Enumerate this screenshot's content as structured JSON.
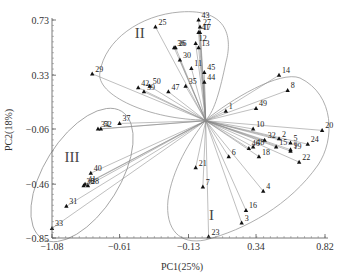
{
  "chart_data": {
    "type": "scatter",
    "subtype": "pca-biplot",
    "title": "",
    "xlabel": "PC1(25%)",
    "ylabel": "PC2(18%)",
    "xlim": [
      -1.08,
      0.82
    ],
    "ylim": [
      -0.85,
      0.73
    ],
    "xticks": [
      -1.08,
      -0.61,
      -0.13,
      0.34,
      0.82
    ],
    "xtick_labels": [
      "-1.08",
      "-0.61",
      "-0.13",
      "0.34",
      "0.82"
    ],
    "yticks": [
      0.73,
      0.33,
      -0.06,
      -0.46,
      -0.85
    ],
    "ytick_labels": [
      "0.73",
      "0.33",
      "-0.06",
      "-0.46",
      "-0.85"
    ],
    "grid": false,
    "origin": [
      -0.01,
      0.0
    ],
    "groups": [
      {
        "name": "I",
        "label_pos": [
          0.03,
          -0.72
        ]
      },
      {
        "name": "II",
        "label_pos": [
          -0.47,
          0.6
        ]
      },
      {
        "name": "III",
        "label_pos": [
          -0.94,
          -0.3
        ]
      }
    ],
    "points": [
      {
        "id": "25",
        "x": -0.36,
        "y": 0.68,
        "group": "II"
      },
      {
        "id": "29",
        "x": -0.8,
        "y": 0.34,
        "group": "II"
      },
      {
        "id": "42",
        "x": -0.48,
        "y": 0.24,
        "group": "II"
      },
      {
        "id": "39",
        "x": -0.44,
        "y": 0.21,
        "group": "II"
      },
      {
        "id": "50",
        "x": -0.4,
        "y": 0.25,
        "group": "II"
      },
      {
        "id": "47",
        "x": -0.27,
        "y": 0.21,
        "group": "II"
      },
      {
        "id": "35",
        "x": -0.15,
        "y": 0.25,
        "group": "II"
      },
      {
        "id": "36",
        "x": -0.23,
        "y": 0.53,
        "group": "II"
      },
      {
        "id": "26",
        "x": -0.22,
        "y": 0.53,
        "group": "II"
      },
      {
        "id": "30",
        "x": -0.19,
        "y": 0.44,
        "group": "II"
      },
      {
        "id": "11",
        "x": -0.11,
        "y": 0.38,
        "group": "II"
      },
      {
        "id": "45",
        "x": -0.02,
        "y": 0.35,
        "group": "II"
      },
      {
        "id": "44",
        "x": -0.02,
        "y": 0.28,
        "group": "II"
      },
      {
        "id": "43",
        "x": -0.06,
        "y": 0.73,
        "group": "II"
      },
      {
        "id": "27",
        "x": -0.05,
        "y": 0.68,
        "group": "II"
      },
      {
        "id": "17",
        "x": -0.05,
        "y": 0.64,
        "group": "II"
      },
      {
        "id": "41",
        "x": -0.06,
        "y": 0.64,
        "group": "II"
      },
      {
        "id": "12",
        "x": -0.08,
        "y": 0.56,
        "group": "II"
      },
      {
        "id": "13",
        "x": -0.06,
        "y": 0.53,
        "group": "II"
      },
      {
        "id": "14",
        "x": 0.5,
        "y": 0.33,
        "group": "I"
      },
      {
        "id": "8",
        "x": 0.56,
        "y": 0.22,
        "group": "I"
      },
      {
        "id": "1",
        "x": 0.13,
        "y": 0.07,
        "group": "I"
      },
      {
        "id": "49",
        "x": 0.34,
        "y": 0.09,
        "group": "I"
      },
      {
        "id": "10",
        "x": 0.32,
        "y": -0.06,
        "group": "I"
      },
      {
        "id": "20",
        "x": 0.8,
        "y": -0.07,
        "group": "I"
      },
      {
        "id": "2",
        "x": 0.5,
        "y": -0.13,
        "group": "I"
      },
      {
        "id": "32",
        "x": 0.4,
        "y": -0.14,
        "group": "I"
      },
      {
        "id": "24",
        "x": 0.7,
        "y": -0.17,
        "group": "I"
      },
      {
        "id": "5",
        "x": 0.58,
        "y": -0.16,
        "group": "I"
      },
      {
        "id": "15",
        "x": 0.48,
        "y": -0.19,
        "group": "I"
      },
      {
        "id": "48",
        "x": 0.32,
        "y": -0.19,
        "group": "I"
      },
      {
        "id": "46",
        "x": 0.29,
        "y": -0.2,
        "group": "I"
      },
      {
        "id": "19",
        "x": 0.58,
        "y": -0.22,
        "group": "I"
      },
      {
        "id": "9",
        "x": 0.58,
        "y": -0.21,
        "group": "I"
      },
      {
        "id": "18",
        "x": 0.36,
        "y": -0.26,
        "group": "I"
      },
      {
        "id": "22",
        "x": 0.64,
        "y": -0.3,
        "group": "I"
      },
      {
        "id": "6",
        "x": 0.15,
        "y": -0.26,
        "group": "I"
      },
      {
        "id": "21",
        "x": -0.08,
        "y": -0.34,
        "group": "I"
      },
      {
        "id": "7",
        "x": -0.03,
        "y": -0.48,
        "group": "I"
      },
      {
        "id": "4",
        "x": 0.39,
        "y": -0.51,
        "group": "I"
      },
      {
        "id": "16",
        "x": 0.27,
        "y": -0.65,
        "group": "I"
      },
      {
        "id": "3",
        "x": 0.24,
        "y": -0.74,
        "group": "I"
      },
      {
        "id": "23",
        "x": 0.01,
        "y": -0.84,
        "group": "I"
      },
      {
        "id": "37",
        "x": -0.61,
        "y": -0.02,
        "group": "III"
      },
      {
        "id": "34",
        "x": -0.76,
        "y": -0.06,
        "group": "III"
      },
      {
        "id": "52",
        "x": -0.74,
        "y": -0.06,
        "group": "III"
      },
      {
        "id": "40",
        "x": -0.81,
        "y": -0.38,
        "group": "III"
      },
      {
        "id": "41b",
        "x": -0.85,
        "y": -0.46,
        "group": "III"
      },
      {
        "id": "38",
        "x": -0.86,
        "y": -0.47,
        "group": "III"
      },
      {
        "id": "28",
        "x": -0.83,
        "y": -0.47,
        "group": "III"
      },
      {
        "id": "31",
        "x": -0.98,
        "y": -0.62,
        "group": "III"
      },
      {
        "id": "33",
        "x": -1.08,
        "y": -0.78,
        "group": "III"
      }
    ]
  },
  "labels": {
    "xlabel": "PC1(25%)",
    "ylabel": "PC2(18%)",
    "group_I": "I",
    "group_II": "II",
    "group_III": "III"
  }
}
